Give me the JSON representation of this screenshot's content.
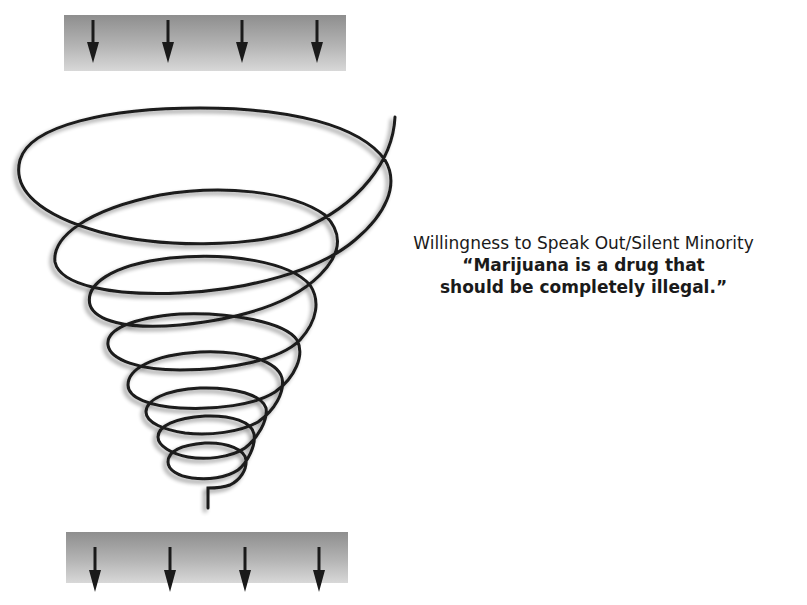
{
  "diagram": {
    "type": "spiral-of-silence",
    "caption": {
      "title": "Willingness to Speak Out/Silent Minority",
      "quote_line1": "“Marijuana is a drug that",
      "quote_line2": "should be completely illegal.”"
    },
    "top_band": {
      "arrow_count": 4,
      "direction": "down"
    },
    "bottom_band": {
      "arrow_count": 4,
      "direction": "down"
    },
    "spiral": {
      "loops": 8,
      "shape": "downward-narrowing funnel"
    },
    "colors": {
      "line": "#1a1a1a",
      "band_dark": "#8e8e8e",
      "band_light": "#d8d8d8",
      "background": "#ffffff"
    }
  }
}
